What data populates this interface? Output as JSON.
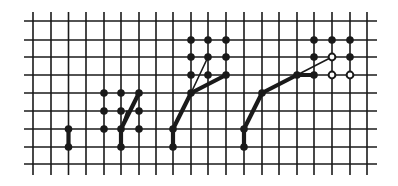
{
  "diagram": {
    "type": "grid-path-figures",
    "background": "#ffffff",
    "ink": "#1a1a1a",
    "grid": {
      "columns_x": [
        33,
        51,
        68.5,
        86,
        104,
        121,
        139,
        156,
        173,
        191,
        208,
        226,
        244,
        262,
        279,
        297,
        314,
        332,
        350,
        367
      ],
      "rows_y": [
        21,
        40,
        57,
        75,
        93,
        111,
        129,
        147,
        164
      ],
      "h_extent": [
        24,
        377
      ],
      "v_extent": [
        12,
        175
      ],
      "line_width": 1.6
    },
    "figures": [
      {
        "name": "figure-1",
        "dots": [
          [
            68.5,
            129
          ],
          [
            68.5,
            147
          ]
        ],
        "thick_paths": [
          [
            [
              68.5,
              147
            ],
            [
              68.5,
              129
            ]
          ]
        ],
        "thin_paths": []
      },
      {
        "name": "figure-2",
        "dots": [
          [
            104,
            93
          ],
          [
            121,
            93
          ],
          [
            139,
            93
          ],
          [
            104,
            111
          ],
          [
            121,
            111
          ],
          [
            139,
            111
          ],
          [
            104,
            129
          ],
          [
            121,
            129
          ],
          [
            139,
            129
          ],
          [
            121,
            147
          ]
        ],
        "thick_paths": [
          [
            [
              121,
              147
            ],
            [
              121,
              129
            ],
            [
              139,
              93
            ]
          ]
        ],
        "thin_paths": [
          [
            [
              121,
              129
            ],
            [
              127,
              111
            ]
          ]
        ]
      },
      {
        "name": "figure-3",
        "dots": [
          [
            191,
            40
          ],
          [
            208,
            40
          ],
          [
            226,
            40
          ],
          [
            191,
            57
          ],
          [
            208,
            57
          ],
          [
            226,
            57
          ],
          [
            191,
            75
          ],
          [
            208,
            75
          ],
          [
            226,
            75
          ],
          [
            191,
            93
          ],
          [
            173,
            129
          ],
          [
            173,
            147
          ]
        ],
        "thick_paths": [
          [
            [
              173,
              147
            ],
            [
              173,
              129
            ],
            [
              191,
              93
            ],
            [
              226,
              75
            ]
          ]
        ],
        "thin_paths": [
          [
            [
              191,
              93
            ],
            [
              208,
              57
            ]
          ]
        ]
      },
      {
        "name": "figure-4",
        "dots": [
          [
            314,
            40
          ],
          [
            332,
            40
          ],
          [
            350,
            40
          ],
          [
            314,
            57
          ],
          [
            350,
            57
          ],
          [
            314,
            75
          ],
          [
            297,
            75
          ],
          [
            262,
            93
          ],
          [
            244,
            129
          ],
          [
            244,
            147
          ]
        ],
        "hollow_dots": [
          [
            332,
            57
          ],
          [
            332,
            75
          ],
          [
            350,
            75
          ]
        ],
        "thick_paths": [
          [
            [
              244,
              147
            ],
            [
              244,
              129
            ],
            [
              262,
              93
            ],
            [
              297,
              75
            ],
            [
              314,
              75
            ]
          ]
        ],
        "thin_paths": [
          [
            [
              297,
              75
            ],
            [
              332,
              57
            ]
          ]
        ]
      }
    ]
  }
}
